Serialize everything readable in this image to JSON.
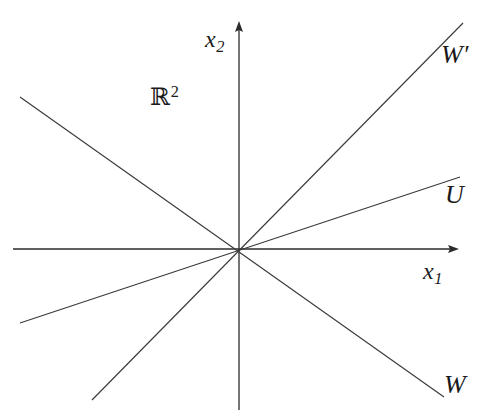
{
  "figure": {
    "background_color": "#ffffff",
    "stroke_color": "#2b2b2b",
    "width": 497,
    "height": 419
  },
  "axes": {
    "origin": {
      "x": 239,
      "y": 249
    },
    "x_axis": {
      "label_base": "x",
      "label_sub": "1",
      "from": {
        "x": 13,
        "y": 249
      },
      "to": {
        "x": 458,
        "y": 249
      },
      "arrow": "right"
    },
    "y_axis": {
      "label_base": "x",
      "label_sub": "2",
      "from": {
        "x": 239,
        "y": 410
      },
      "to": {
        "x": 239,
        "y": 22
      },
      "arrow": "up"
    }
  },
  "plane_label": {
    "base": "ℝ",
    "sup": "2",
    "x": 150,
    "y": 84
  },
  "lines": [
    {
      "name": "W-prime",
      "label": "W",
      "label_prime": "′",
      "from": {
        "x": 92,
        "y": 400
      },
      "to": {
        "x": 463,
        "y": 23
      },
      "slope": 1.016,
      "label_x": 441,
      "label_y": 42
    },
    {
      "name": "U",
      "label": "U",
      "label_prime": "",
      "from": {
        "x": 20,
        "y": 323
      },
      "to": {
        "x": 460,
        "y": 177
      },
      "slope": 0.332,
      "label_x": 445,
      "label_y": 182
    },
    {
      "name": "W",
      "label": "W",
      "label_prime": "",
      "from": {
        "x": 20,
        "y": 97
      },
      "to": {
        "x": 444,
        "y": 397
      },
      "slope": -0.708,
      "label_x": 444,
      "label_y": 372
    }
  ]
}
